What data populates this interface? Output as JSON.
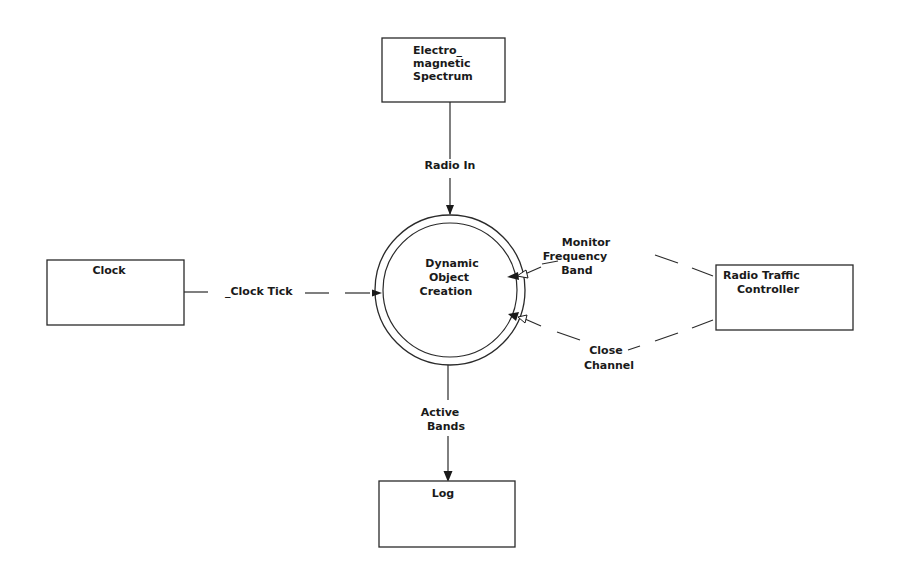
{
  "diagram": {
    "type": "context data flow diagram",
    "process": {
      "name": "process-dynamic-object-creation",
      "lines": [
        "Dynamic",
        "Object",
        "Creation"
      ]
    },
    "external_entities": [
      {
        "id": "electromagnetic-spectrum",
        "lines": [
          "Electro_",
          "magnetic",
          "Spectrum"
        ]
      },
      {
        "id": "clock",
        "lines": [
          "Clock"
        ]
      },
      {
        "id": "radio-traffic-controller",
        "lines": [
          "Radio Traffic",
          "Controller"
        ]
      },
      {
        "id": "log",
        "lines": [
          "Log"
        ]
      }
    ],
    "flows": [
      {
        "id": "radio-in",
        "lines": [
          "Radio In"
        ],
        "from": "electromagnetic-spectrum",
        "to": "process",
        "style": "solid"
      },
      {
        "id": "clock-tick",
        "lines": [
          "_Clock Tick"
        ],
        "from": "clock",
        "to": "process",
        "style": "dashed"
      },
      {
        "id": "monitor-frequency-band",
        "lines": [
          "Monitor",
          "Frequency",
          "Band"
        ],
        "from": "radio-traffic-controller",
        "to": "process",
        "style": "dashed"
      },
      {
        "id": "close-channel",
        "lines": [
          "Close",
          "Channel"
        ],
        "from": "radio-traffic-controller",
        "to": "process",
        "style": "dashed"
      },
      {
        "id": "active-bands",
        "lines": [
          "Active",
          "Bands"
        ],
        "from": "process",
        "to": "log",
        "style": "solid"
      }
    ]
  }
}
